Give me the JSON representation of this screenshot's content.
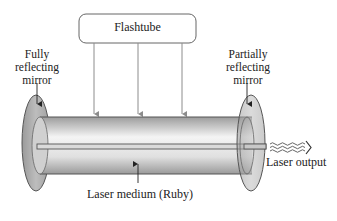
{
  "diagram": {
    "flashtube": {
      "label": "Flashtube"
    },
    "left_mirror": {
      "label_lines": [
        "Fully",
        "reflecting",
        "mirror"
      ]
    },
    "right_mirror": {
      "label_lines": [
        "Partially",
        "reflecting",
        "mirror"
      ]
    },
    "medium": {
      "label": "Laser medium (Ruby)"
    },
    "output": {
      "label": "Laser output"
    },
    "colors": {
      "outline": "#555555",
      "mirror_fill": "#a8a8a8",
      "tube_light": "#f2f2f2",
      "tube_dark": "#9a9a9a",
      "rod_fill": "#d9d9d9",
      "arrow": "#8c8c8c"
    }
  }
}
